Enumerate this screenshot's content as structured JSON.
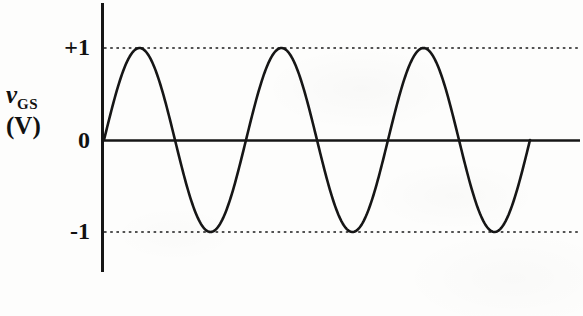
{
  "figure": {
    "kind": "line-plot",
    "background_color": "#fdfdfc",
    "ink_color": "#161616"
  },
  "axis": {
    "y_label_symbol": "v",
    "y_label_subscript": "GS",
    "y_label_unit": "(V)",
    "tick_plus_one": "+1",
    "tick_zero": "0",
    "tick_minus_one": "-1",
    "y_axis_line_name": "vertical-axis",
    "zero_line_name": "zero-baseline"
  },
  "gridlines": {
    "upper_dotted_value": "+1",
    "lower_dotted_value": "-1"
  },
  "chart_data": {
    "type": "line",
    "title": "",
    "xlabel": "",
    "ylabel": "vGS (V)",
    "ylim": [
      -1.45,
      1.45
    ],
    "xlim": [
      0,
      3.4
    ],
    "grid": "dotted horizontal gridlines at +1 and -1 only",
    "legend": "none",
    "waveform": {
      "shape": "sine",
      "amplitude": 1,
      "offset": 0,
      "cycles": 3,
      "phase": "starts at 0 rising",
      "equation": "vGS = 1 * sin(2*pi*t)"
    },
    "annotations": [
      {
        "label": "+1",
        "y": 1,
        "kind": "tick-and-dotted-line"
      },
      {
        "label": "0",
        "y": 0,
        "kind": "tick-and-baseline"
      },
      {
        "label": "-1",
        "y": -1,
        "kind": "tick-and-dotted-line"
      }
    ],
    "x": [
      0,
      0.125,
      0.25,
      0.375,
      0.5,
      0.625,
      0.75,
      0.875,
      1,
      1.125,
      1.25,
      1.375,
      1.5,
      1.625,
      1.75,
      1.875,
      2,
      2.125,
      2.25,
      2.375,
      2.5,
      2.625,
      2.75,
      2.875,
      3
    ],
    "values": [
      0,
      0.707,
      1,
      0.707,
      0,
      -0.707,
      -1,
      -0.707,
      0,
      0.707,
      1,
      0.707,
      0,
      -0.707,
      -1,
      -0.707,
      0,
      0.707,
      1,
      0.707,
      0,
      -0.707,
      -1,
      -0.707,
      0
    ],
    "peaks": [
      {
        "x": 0.25,
        "y": 1
      },
      {
        "x": 1.25,
        "y": 1
      },
      {
        "x": 2.25,
        "y": 1
      }
    ],
    "troughs": [
      {
        "x": 0.75,
        "y": -1
      },
      {
        "x": 1.75,
        "y": -1
      },
      {
        "x": 2.75,
        "y": -1
      }
    ],
    "zero_crossings": [
      0,
      0.5,
      1,
      1.5,
      2,
      2.5,
      3
    ]
  }
}
